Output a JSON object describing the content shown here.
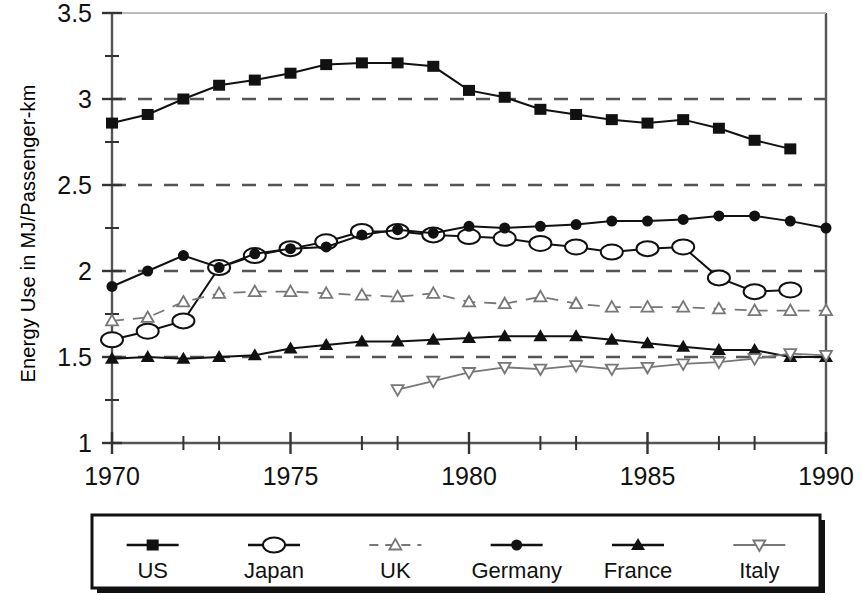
{
  "chart_data": {
    "type": "line",
    "title": "",
    "xlabel": "",
    "ylabel": "Energy Use in MJ/Passenger-km",
    "xlim": [
      1970,
      1990
    ],
    "ylim": [
      1,
      3.5
    ],
    "xticks": [
      1970,
      1975,
      1980,
      1985,
      1990
    ],
    "xtick_labels": [
      "1970",
      "1975",
      "1980",
      "1985",
      "1990"
    ],
    "xticks_minor": [
      1971,
      1972,
      1973,
      1974,
      1976,
      1977,
      1978,
      1979,
      1981,
      1982,
      1983,
      1984,
      1986,
      1987,
      1988,
      1989
    ],
    "yticks": [
      1,
      1.5,
      2,
      2.5,
      3,
      3.5
    ],
    "ytick_labels": [
      "1",
      "1.5",
      "2",
      "2.5",
      "3",
      "3.5"
    ],
    "yticks_minor": [
      1.25,
      1.75,
      2.25,
      2.75,
      3.25
    ],
    "gridlines_y": [
      1.5,
      2,
      2.5,
      3
    ],
    "grid": "horizontal-dashed",
    "legend_position": "below-axes-box",
    "series": [
      {
        "name": "US",
        "marker": "filled-square",
        "line": "solid",
        "x": [
          1970,
          1971,
          1972,
          1973,
          1974,
          1975,
          1976,
          1977,
          1978,
          1979,
          1980,
          1981,
          1982,
          1983,
          1984,
          1985,
          1986,
          1987,
          1988,
          1989
        ],
        "values": [
          2.86,
          2.91,
          3.0,
          3.08,
          3.11,
          3.15,
          3.2,
          3.21,
          3.21,
          3.19,
          3.05,
          3.01,
          2.94,
          2.91,
          2.88,
          2.86,
          2.88,
          2.83,
          2.76,
          2.71
        ]
      },
      {
        "name": "Japan",
        "marker": "open-ellipse",
        "line": "solid",
        "x": [
          1970,
          1971,
          1972,
          1973,
          1974,
          1975,
          1976,
          1977,
          1978,
          1979,
          1980,
          1981,
          1982,
          1983,
          1984,
          1985,
          1986,
          1987,
          1988,
          1989
        ],
        "values": [
          1.6,
          1.65,
          1.71,
          2.02,
          2.09,
          2.13,
          2.17,
          2.23,
          2.23,
          2.21,
          2.2,
          2.19,
          2.16,
          2.14,
          2.11,
          2.13,
          2.14,
          1.96,
          1.88,
          1.89
        ]
      },
      {
        "name": "UK",
        "marker": "open-triangle-up",
        "line": "dashed",
        "x": [
          1970,
          1971,
          1972,
          1973,
          1974,
          1975,
          1976,
          1977,
          1978,
          1979,
          1980,
          1981,
          1982,
          1983,
          1984,
          1985,
          1986,
          1987,
          1988,
          1989,
          1990
        ],
        "values": [
          1.71,
          1.73,
          1.82,
          1.87,
          1.88,
          1.88,
          1.87,
          1.86,
          1.85,
          1.87,
          1.82,
          1.81,
          1.85,
          1.81,
          1.79,
          1.79,
          1.79,
          1.78,
          1.77,
          1.77,
          1.77
        ]
      },
      {
        "name": "Germany",
        "marker": "filled-circle",
        "line": "solid",
        "x": [
          1970,
          1971,
          1972,
          1973,
          1974,
          1975,
          1976,
          1977,
          1978,
          1979,
          1980,
          1981,
          1982,
          1983,
          1984,
          1985,
          1986,
          1987,
          1988,
          1989,
          1990
        ],
        "values": [
          1.91,
          2.0,
          2.09,
          2.02,
          2.1,
          2.13,
          2.14,
          2.21,
          2.24,
          2.22,
          2.26,
          2.25,
          2.26,
          2.27,
          2.29,
          2.29,
          2.3,
          2.32,
          2.32,
          2.29,
          2.25
        ]
      },
      {
        "name": "France",
        "marker": "filled-triangle-up",
        "line": "solid",
        "x": [
          1970,
          1971,
          1972,
          1973,
          1974,
          1975,
          1976,
          1977,
          1978,
          1979,
          1980,
          1981,
          1982,
          1983,
          1984,
          1985,
          1986,
          1987,
          1988,
          1989,
          1990
        ],
        "values": [
          1.49,
          1.5,
          1.49,
          1.5,
          1.51,
          1.55,
          1.57,
          1.59,
          1.59,
          1.6,
          1.61,
          1.62,
          1.62,
          1.62,
          1.6,
          1.58,
          1.56,
          1.54,
          1.54,
          1.5,
          1.5
        ]
      },
      {
        "name": "Italy",
        "marker": "open-triangle-down",
        "line": "solid",
        "x": [
          1978,
          1979,
          1980,
          1981,
          1982,
          1983,
          1984,
          1985,
          1986,
          1987,
          1988,
          1989,
          1990
        ],
        "values": [
          1.31,
          1.36,
          1.41,
          1.44,
          1.43,
          1.45,
          1.43,
          1.44,
          1.46,
          1.47,
          1.49,
          1.52,
          1.51
        ]
      }
    ]
  },
  "legend": {
    "items": [
      {
        "label": "US",
        "marker": "filled-square",
        "line": "solid"
      },
      {
        "label": "Japan",
        "marker": "open-ellipse",
        "line": "solid"
      },
      {
        "label": "UK",
        "marker": "open-triangle-up",
        "line": "dashed"
      },
      {
        "label": "Germany",
        "marker": "filled-circle",
        "line": "solid"
      },
      {
        "label": "France",
        "marker": "filled-triangle-up",
        "line": "solid"
      },
      {
        "label": "Italy",
        "marker": "open-triangle-down",
        "line": "solid"
      }
    ]
  },
  "colors": {
    "ink": "#111111",
    "grid": "#555555",
    "background": "#ffffff",
    "light_marker": "#777777"
  }
}
